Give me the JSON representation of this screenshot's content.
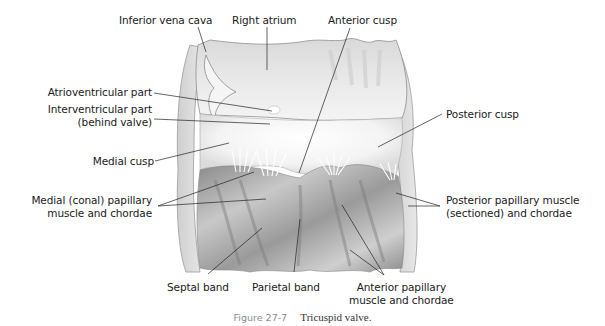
{
  "figure": {
    "title": "Tricuspid valve",
    "caption": {
      "number": "Figure 27-7",
      "text": "Tricuspid valve."
    },
    "colors": {
      "background": "#ffffff",
      "label_text": "#1a1a1a",
      "leader_line": "#222222",
      "caption_number": "#8a8a8a",
      "tissue_light": "#f2f2f2",
      "tissue_mid": "#bdbdbd",
      "tissue_dark": "#7a7a7a"
    },
    "labels": {
      "inferior_vena_cava": "Inferior vena cava",
      "right_atrium": "Right atrium",
      "anterior_cusp": "Anterior cusp",
      "atrioventricular_part": "Atrioventricular part",
      "interventricular_part_1": "Interventricular part",
      "interventricular_part_2": "(behind valve)",
      "posterior_cusp": "Posterior cusp",
      "medial_cusp": "Medial cusp",
      "medial_papillary_1": "Medial (conal) papillary",
      "medial_papillary_2": "muscle and chordae",
      "posterior_papillary_1": "Posterior papillary muscle",
      "posterior_papillary_2": "(sectioned) and chordae",
      "septal_band": "Septal band",
      "parietal_band": "Parietal band",
      "anterior_papillary_1": "Anterior papillary",
      "anterior_papillary_2": "muscle and chordae"
    }
  }
}
